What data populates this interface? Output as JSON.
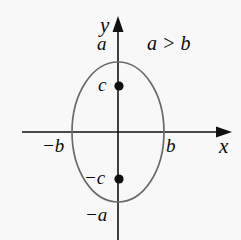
{
  "figure": {
    "name": "vertical-ellipse-with-foci-diagram",
    "background_color": "#f8f8f8",
    "axis_color": "#111111",
    "curve_color": "#6a6a6a",
    "point_color": "#101010",
    "axes": {
      "x_label": "x",
      "y_label": "y",
      "origin_px": [
        118,
        132
      ],
      "x_axis_extent_px": [
        22,
        232
      ],
      "y_axis_extent_px": [
        16,
        240
      ]
    },
    "condition_label": "a > b",
    "ticks": {
      "y_top": "a",
      "y_bottom": "−a",
      "x_right": "b",
      "x_left": "−b",
      "focus_upper": "c",
      "focus_lower": "−c"
    },
    "ellipse": {
      "center_px": [
        118,
        132
      ],
      "semi_minor_axis_px": 46,
      "semi_major_axis_px": 70,
      "orientation": "vertical",
      "vertex_top_px": [
        118,
        62
      ],
      "vertex_bottom_px": [
        118,
        202
      ],
      "covertex_left_px": [
        72,
        132
      ],
      "covertex_right_px": [
        164,
        132
      ]
    },
    "foci": [
      {
        "label": "c",
        "position_px": [
          119,
          86
        ]
      },
      {
        "label": "−c",
        "position_px": [
          119,
          179
        ]
      }
    ]
  }
}
